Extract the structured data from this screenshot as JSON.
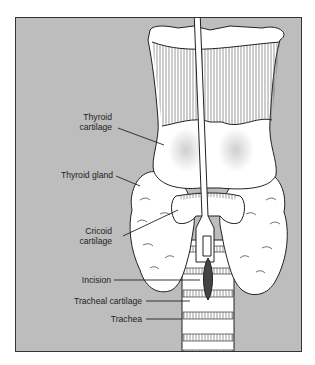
{
  "diagram": {
    "type": "anatomical illustration",
    "colors": {
      "background": "#bdbdbd",
      "structure": "#ffffff",
      "outline": "#222222"
    },
    "labels": [
      {
        "id": "thyroid-cartilage",
        "line1": "Thyroid",
        "line2": "cartilage"
      },
      {
        "id": "thyroid-gland",
        "line1": "Thyroid gland"
      },
      {
        "id": "cricoid-cartilage",
        "line1": "Cricoid",
        "line2": "cartilage"
      },
      {
        "id": "incision",
        "line1": "Incision"
      },
      {
        "id": "tracheal-cartilage",
        "line1": "Tracheal cartilage"
      },
      {
        "id": "trachea",
        "line1": "Trachea"
      }
    ]
  }
}
